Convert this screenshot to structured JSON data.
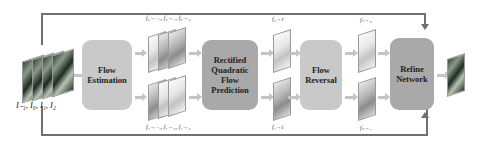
{
  "diagram": {
    "input_label": "I₋₁, I₀, I₁, I₂",
    "blocks": {
      "flow_estimation": "Flow Estimation",
      "rectified_quadratic": "Rectified Quadratic Flow Prediction",
      "flow_reversal": "Flow Reversal",
      "refine_network": "Refine Network"
    },
    "flow_labels": {
      "estimation_top": "f₀→₋₁, f₀→₁, f₀→₂",
      "estimation_bottom": "f₁→₋₁, f₁→₀, f₁→₂",
      "quadratic_top": "f₀→t",
      "quadratic_bottom": "f₁→t",
      "reversal_top": "fₜ→₀",
      "reversal_bottom": "fₜ→₁"
    },
    "colors": {
      "light_block": "#c9c9c9",
      "dark_block": "#a9a9a9",
      "loop_line": "#707070",
      "arrow": "#c4c4c4"
    }
  }
}
